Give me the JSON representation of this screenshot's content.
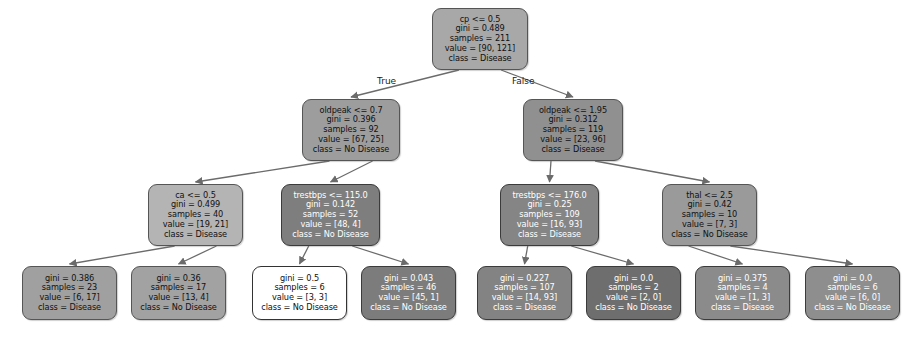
{
  "diagram": {
    "type": "decision-tree",
    "canvas": {
      "width": 917,
      "height": 340,
      "background": "#ffffff"
    },
    "edge_labels": {
      "true_label": "True",
      "false_label": "False"
    },
    "class_names": [
      "No Disease",
      "Disease"
    ],
    "palette": {
      "class_no_disease": "#b0b0b0",
      "class_disease": "#8f8f8f",
      "pure_dark": "#5a5a5a",
      "impure_light": "#ffffff",
      "edge_stroke": "#6b6b6b",
      "node_border": "#555555",
      "text_dark": "#111111",
      "text_light": "#ffffff"
    },
    "nodes": [
      {
        "id": "n0",
        "depth": 0,
        "x": 432,
        "y": 8,
        "w": 96,
        "h": 62,
        "fill": "#a8a8a8",
        "dark": false,
        "lines": [
          "cp <= 0.5",
          "gini = 0.489",
          "samples = 211",
          "value = [90, 121]",
          "class = Disease"
        ],
        "feature": "cp",
        "threshold": 0.5,
        "gini": 0.489,
        "samples": 211,
        "value": [
          90,
          121
        ],
        "class": "Disease"
      },
      {
        "id": "n1",
        "depth": 1,
        "x": 302,
        "y": 99,
        "w": 98,
        "h": 62,
        "fill": "#9d9d9d",
        "dark": false,
        "lines": [
          "oldpeak <= 0.7",
          "gini = 0.396",
          "samples = 92",
          "value = [67, 25]",
          "class = No Disease"
        ],
        "feature": "oldpeak",
        "threshold": 0.7,
        "gini": 0.396,
        "samples": 92,
        "value": [
          67,
          25
        ],
        "class": "No Disease"
      },
      {
        "id": "n2",
        "depth": 1,
        "x": 523,
        "y": 99,
        "w": 100,
        "h": 62,
        "fill": "#909090",
        "dark": false,
        "lines": [
          "oldpeak <= 1.95",
          "gini = 0.312",
          "samples = 119",
          "value = [23, 96]",
          "class = Disease"
        ],
        "feature": "oldpeak",
        "threshold": 1.95,
        "gini": 0.312,
        "samples": 119,
        "value": [
          23,
          96
        ],
        "class": "Disease"
      },
      {
        "id": "n3",
        "depth": 2,
        "x": 148,
        "y": 184,
        "w": 95,
        "h": 62,
        "fill": "#b4b4b4",
        "dark": false,
        "lines": [
          "ca <= 0.5",
          "gini = 0.499",
          "samples = 40",
          "value = [19, 21]",
          "class = Disease"
        ],
        "feature": "ca",
        "threshold": 0.5,
        "gini": 0.499,
        "samples": 40,
        "value": [
          19,
          21
        ],
        "class": "Disease"
      },
      {
        "id": "n4",
        "depth": 2,
        "x": 281,
        "y": 184,
        "w": 99,
        "h": 62,
        "fill": "#7e7e7e",
        "dark": true,
        "lines": [
          "trestbps <= 115.0",
          "gini = 0.142",
          "samples = 52",
          "value = [48, 4]",
          "class = No Disease"
        ],
        "feature": "trestbps",
        "threshold": 115.0,
        "gini": 0.142,
        "samples": 52,
        "value": [
          48,
          4
        ],
        "class": "No Disease"
      },
      {
        "id": "n5",
        "depth": 2,
        "x": 500,
        "y": 184,
        "w": 99,
        "h": 62,
        "fill": "#858585",
        "dark": true,
        "lines": [
          "trestbps <= 176.0",
          "gini = 0.25",
          "samples = 109",
          "value = [16, 93]",
          "class = Disease"
        ],
        "feature": "trestbps",
        "threshold": 176.0,
        "gini": 0.25,
        "samples": 109,
        "value": [
          16,
          93
        ],
        "class": "Disease"
      },
      {
        "id": "n6",
        "depth": 2,
        "x": 662,
        "y": 184,
        "w": 95,
        "h": 62,
        "fill": "#9a9a9a",
        "dark": false,
        "lines": [
          "thal <= 2.5",
          "gini = 0.42",
          "samples = 10",
          "value = [7, 3]",
          "class = No Disease"
        ],
        "feature": "thal",
        "threshold": 2.5,
        "gini": 0.42,
        "samples": 10,
        "value": [
          7,
          3
        ],
        "class": "No Disease"
      },
      {
        "id": "l0",
        "depth": 3,
        "x": 22,
        "y": 266,
        "w": 95,
        "h": 54,
        "fill": "#a0a0a0",
        "dark": false,
        "lines": [
          "gini = 0.386",
          "samples = 23",
          "value = [6, 17]",
          "class = Disease"
        ],
        "gini": 0.386,
        "samples": 23,
        "value": [
          6,
          17
        ],
        "class": "Disease"
      },
      {
        "id": "l1",
        "depth": 3,
        "x": 131,
        "y": 266,
        "w": 95,
        "h": 54,
        "fill": "#a2a2a2",
        "dark": false,
        "lines": [
          "gini = 0.36",
          "samples = 17",
          "value = [13, 4]",
          "class = No Disease"
        ],
        "gini": 0.36,
        "samples": 17,
        "value": [
          13,
          4
        ],
        "class": "No Disease"
      },
      {
        "id": "l2",
        "depth": 3,
        "x": 252,
        "y": 266,
        "w": 95,
        "h": 54,
        "fill": "#ffffff",
        "dark": false,
        "lines": [
          "gini = 0.5",
          "samples = 6",
          "value = [3, 3]",
          "class = No Disease"
        ],
        "gini": 0.5,
        "samples": 6,
        "value": [
          3,
          3
        ],
        "class": "No Disease"
      },
      {
        "id": "l3",
        "depth": 3,
        "x": 361,
        "y": 266,
        "w": 95,
        "h": 54,
        "fill": "#7c7c7c",
        "dark": true,
        "lines": [
          "gini = 0.043",
          "samples = 46",
          "value = [45, 1]",
          "class = No Disease"
        ],
        "gini": 0.043,
        "samples": 46,
        "value": [
          45,
          1
        ],
        "class": "No Disease"
      },
      {
        "id": "l4",
        "depth": 3,
        "x": 477,
        "y": 266,
        "w": 95,
        "h": 54,
        "fill": "#838383",
        "dark": true,
        "lines": [
          "gini = 0.227",
          "samples = 107",
          "value = [14, 93]",
          "class = Disease"
        ],
        "gini": 0.227,
        "samples": 107,
        "value": [
          14,
          93
        ],
        "class": "Disease"
      },
      {
        "id": "l5",
        "depth": 3,
        "x": 586,
        "y": 266,
        "w": 95,
        "h": 54,
        "fill": "#6e6e6e",
        "dark": true,
        "lines": [
          "gini = 0.0",
          "samples = 2",
          "value = [2, 0]",
          "class = No Disease"
        ],
        "gini": 0.0,
        "samples": 2,
        "value": [
          2,
          0
        ],
        "class": "No Disease"
      },
      {
        "id": "l6",
        "depth": 3,
        "x": 695,
        "y": 266,
        "w": 95,
        "h": 54,
        "fill": "#8b8b8b",
        "dark": true,
        "lines": [
          "gini = 0.375",
          "samples = 4",
          "value = [1, 3]",
          "class = Disease"
        ],
        "gini": 0.375,
        "samples": 4,
        "value": [
          1,
          3
        ],
        "class": "Disease"
      },
      {
        "id": "l7",
        "depth": 3,
        "x": 805,
        "y": 266,
        "w": 95,
        "h": 54,
        "fill": "#8e8e8e",
        "dark": true,
        "lines": [
          "gini = 0.0",
          "samples = 6",
          "value = [6, 0]",
          "class = No Disease"
        ],
        "gini": 0.0,
        "samples": 6,
        "value": [
          6,
          0
        ],
        "class": "No Disease"
      }
    ],
    "edges": [
      {
        "from": "n0",
        "to": "n1",
        "branch": "true",
        "label": "True"
      },
      {
        "from": "n0",
        "to": "n2",
        "branch": "false",
        "label": "False"
      },
      {
        "from": "n1",
        "to": "n3",
        "branch": "true",
        "label": ""
      },
      {
        "from": "n1",
        "to": "n4",
        "branch": "false",
        "label": ""
      },
      {
        "from": "n2",
        "to": "n5",
        "branch": "true",
        "label": ""
      },
      {
        "from": "n2",
        "to": "n6",
        "branch": "false",
        "label": ""
      },
      {
        "from": "n3",
        "to": "l0",
        "branch": "true",
        "label": ""
      },
      {
        "from": "n3",
        "to": "l1",
        "branch": "false",
        "label": ""
      },
      {
        "from": "n4",
        "to": "l2",
        "branch": "true",
        "label": ""
      },
      {
        "from": "n4",
        "to": "l3",
        "branch": "false",
        "label": ""
      },
      {
        "from": "n5",
        "to": "l4",
        "branch": "true",
        "label": ""
      },
      {
        "from": "n5",
        "to": "l5",
        "branch": "false",
        "label": ""
      },
      {
        "from": "n6",
        "to": "l6",
        "branch": "true",
        "label": ""
      },
      {
        "from": "n6",
        "to": "l7",
        "branch": "false",
        "label": ""
      }
    ],
    "edge_label_positions": [
      {
        "text": "True",
        "x": 377,
        "y": 76
      },
      {
        "text": "False",
        "x": 512,
        "y": 76
      }
    ]
  }
}
